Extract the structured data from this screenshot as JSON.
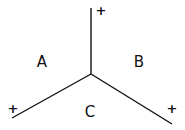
{
  "diagram": {
    "junction": {
      "x": 91,
      "y": 74
    },
    "lines": [
      {
        "name": "top",
        "x2": 91,
        "y2": 8,
        "sign": "+",
        "sign_x": 101,
        "sign_y": 15
      },
      {
        "name": "left",
        "x2": 12,
        "y2": 118,
        "sign": "+",
        "sign_x": 13,
        "sign_y": 113
      },
      {
        "name": "right",
        "x2": 172,
        "y2": 124,
        "sign": "+",
        "sign_x": 172,
        "sign_y": 113
      }
    ],
    "regions": [
      {
        "label": "A",
        "x": 42,
        "y": 67
      },
      {
        "label": "B",
        "x": 139,
        "y": 67
      },
      {
        "label": "C",
        "x": 90,
        "y": 117
      }
    ],
    "stroke_color": "#111111"
  }
}
